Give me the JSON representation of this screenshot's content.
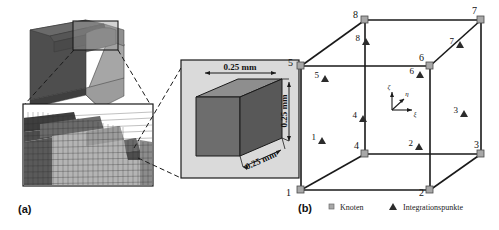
{
  "figure": {
    "panels": [
      {
        "id": "a",
        "label": "(a)"
      },
      {
        "id": "b",
        "label": "(b)"
      }
    ]
  },
  "panel_a": {
    "label": "(a)",
    "description": "Multi-scale finite element mesh refinement from macroscopic specimen to single cubic element",
    "cube_dimensions": {
      "width_label": "0.25 mm",
      "height_label": "0.25 mm",
      "depth_label": "0.25 mm"
    },
    "views": {
      "overview_name": "specimen-3d-block",
      "mesh_name": "refined-mesh-detail",
      "element_name": "single-cubic-element"
    }
  },
  "panel_b": {
    "label": "(b)",
    "description": "Hexahedral element with 8 nodes and 8 integration points",
    "node_numbers": [
      "1",
      "2",
      "3",
      "4",
      "5",
      "6",
      "7",
      "8"
    ],
    "integration_point_numbers": [
      "1",
      "2",
      "3",
      "4",
      "5",
      "6",
      "7",
      "8"
    ],
    "axes": [
      {
        "name": "xi",
        "symbol": "ξ"
      },
      {
        "name": "eta",
        "symbol": "η"
      },
      {
        "name": "zeta",
        "symbol": "ζ"
      }
    ],
    "legend": [
      {
        "marker": "square",
        "label": "Knoten"
      },
      {
        "marker": "triangle",
        "label": "Integrationspunkte"
      }
    ]
  },
  "colors": {
    "background": "#ffffff",
    "line": "#1a1a1a",
    "dark_face": "#4a4a4a",
    "mid_face": "#6e6e6e",
    "light_face": "#9a9a9a",
    "pale_face": "#b8b8b8",
    "inset_bg": "#d8d8d8",
    "node_marker": "#a0a0a0",
    "ip_marker": "#2b2b2b"
  }
}
